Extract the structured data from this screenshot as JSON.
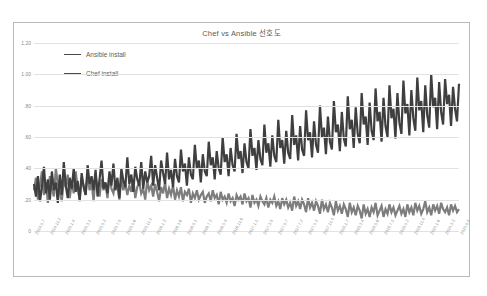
{
  "chart_data": {
    "type": "line",
    "title": "Chef vs Ansible 선호도",
    "xlabel": "",
    "ylabel": "",
    "ylim": [
      0,
      1.2
    ],
    "yticks": [
      0,
      0.2,
      0.4,
      0.6,
      0.8,
      1.0,
      1.2
    ],
    "ytick_labels": [
      "0",
      ".20",
      ".40",
      ".60",
      ".80",
      "1.00",
      "1.20"
    ],
    "grid": true,
    "legend_position": "top-left",
    "x_tick_labels": [
      "2014.9.7",
      "2014.11.2",
      "2015.1.4",
      "2015.3.1",
      "2015.5.3",
      "2015.7.5",
      "2015.9.6",
      "2015.11.1",
      "2016.1.3",
      "2016.3.6",
      "2016.5.1",
      "2016.7.3",
      "2016.9.4",
      "2016.11.6",
      "2017.1.1",
      "2017.3.5",
      "2017.5.7",
      "2017.7.2",
      "2017.9.3",
      "2017.11.5",
      "2018.1.7",
      "2018.3.4",
      "2018.5.6",
      "2018.7.1",
      "2018.9.2",
      "2018.11.4",
      "2019.1.6",
      "2019.3.3",
      "2019.5.5"
    ],
    "series": [
      {
        "name": "Ansible install",
        "values": [
          0.3,
          0.22,
          0.35,
          0.19,
          0.28,
          0.41,
          0.24,
          0.33,
          0.2,
          0.38,
          0.26,
          0.31,
          0.18,
          0.36,
          0.23,
          0.44,
          0.29,
          0.21,
          0.34,
          0.27,
          0.4,
          0.25,
          0.32,
          0.19,
          0.37,
          0.28,
          0.23,
          0.42,
          0.3,
          0.35,
          0.26,
          0.39,
          0.22,
          0.33,
          0.45,
          0.27,
          0.31,
          0.24,
          0.38,
          0.29,
          0.43,
          0.26,
          0.34,
          0.21,
          0.4,
          0.32,
          0.28,
          0.47,
          0.3,
          0.36,
          0.25,
          0.41,
          0.33,
          0.29,
          0.44,
          0.27,
          0.38,
          0.31,
          0.35,
          0.48,
          0.29,
          0.42,
          0.34,
          0.26,
          0.45,
          0.37,
          0.3,
          0.5,
          0.33,
          0.39,
          0.28,
          0.46,
          0.35,
          0.31,
          0.52,
          0.38,
          0.43,
          0.29,
          0.47,
          0.36,
          0.33,
          0.55,
          0.4,
          0.45,
          0.31,
          0.49,
          0.38,
          0.35,
          0.57,
          0.42,
          0.47,
          0.33,
          0.51,
          0.4,
          0.36,
          0.6,
          0.44,
          0.49,
          0.35,
          0.53,
          0.42,
          0.38,
          0.62,
          0.46,
          0.51,
          0.37,
          0.56,
          0.44,
          0.4,
          0.65,
          0.48,
          0.53,
          0.39,
          0.58,
          0.46,
          0.42,
          0.68,
          0.5,
          0.56,
          0.41,
          0.61,
          0.48,
          0.44,
          0.71,
          0.53,
          0.58,
          0.43,
          0.64,
          0.5,
          0.46,
          0.74,
          0.55,
          0.61,
          0.45,
          0.67,
          0.52,
          0.48,
          0.77,
          0.58,
          0.63,
          0.47,
          0.7,
          0.55,
          0.5,
          0.8,
          0.6,
          0.66,
          0.49,
          0.73,
          0.57,
          0.52,
          0.83,
          0.63,
          0.68,
          0.51,
          0.76,
          0.59,
          0.54,
          0.86,
          0.65,
          0.71,
          0.53,
          0.79,
          0.62,
          0.56,
          0.88,
          0.68,
          0.73,
          0.55,
          0.82,
          0.64,
          0.58,
          0.91,
          0.7,
          0.76,
          0.57,
          0.85,
          0.67,
          0.6,
          0.93,
          0.72,
          0.78,
          0.59,
          0.88,
          0.69,
          0.62,
          0.96,
          0.75,
          0.81,
          0.61,
          0.9,
          0.72,
          0.64,
          0.98,
          0.77,
          0.83,
          0.63,
          0.93,
          0.74,
          0.66,
          1.0,
          0.79,
          0.85,
          0.65,
          0.95,
          0.76,
          0.68,
          0.97,
          0.81,
          0.87,
          0.67,
          0.92,
          0.78,
          0.7,
          0.94
        ]
      },
      {
        "name": "Chef install",
        "values": [
          0.26,
          0.34,
          0.2,
          0.29,
          0.38,
          0.23,
          0.31,
          0.18,
          0.35,
          0.27,
          0.22,
          0.4,
          0.3,
          0.25,
          0.19,
          0.33,
          0.28,
          0.36,
          0.21,
          0.31,
          0.24,
          0.38,
          0.27,
          0.2,
          0.34,
          0.29,
          0.23,
          0.37,
          0.26,
          0.31,
          0.19,
          0.35,
          0.28,
          0.22,
          0.33,
          0.26,
          0.3,
          0.21,
          0.36,
          0.27,
          0.24,
          0.32,
          0.28,
          0.2,
          0.34,
          0.26,
          0.3,
          0.23,
          0.29,
          0.25,
          0.33,
          0.21,
          0.28,
          0.31,
          0.24,
          0.27,
          0.2,
          0.32,
          0.26,
          0.29,
          0.22,
          0.3,
          0.25,
          0.19,
          0.28,
          0.24,
          0.31,
          0.21,
          0.27,
          0.23,
          0.29,
          0.2,
          0.26,
          0.22,
          0.28,
          0.19,
          0.25,
          0.23,
          0.27,
          0.18,
          0.24,
          0.21,
          0.26,
          0.2,
          0.23,
          0.25,
          0.18,
          0.22,
          0.24,
          0.19,
          0.26,
          0.21,
          0.23,
          0.17,
          0.25,
          0.2,
          0.22,
          0.18,
          0.24,
          0.19,
          0.21,
          0.16,
          0.23,
          0.2,
          0.22,
          0.17,
          0.24,
          0.19,
          0.21,
          0.15,
          0.23,
          0.18,
          0.2,
          0.16,
          0.22,
          0.19,
          0.17,
          0.21,
          0.15,
          0.2,
          0.18,
          0.22,
          0.16,
          0.19,
          0.14,
          0.21,
          0.17,
          0.2,
          0.15,
          0.18,
          0.13,
          0.22,
          0.16,
          0.19,
          0.14,
          0.2,
          0.17,
          0.12,
          0.21,
          0.15,
          0.18,
          0.13,
          0.19,
          0.16,
          0.11,
          0.2,
          0.14,
          0.17,
          0.12,
          0.18,
          0.15,
          0.1,
          0.19,
          0.13,
          0.16,
          0.11,
          0.17,
          0.14,
          0.09,
          0.18,
          0.12,
          0.15,
          0.1,
          0.16,
          0.13,
          0.08,
          0.17,
          0.11,
          0.14,
          0.09,
          0.15,
          0.12,
          0.18,
          0.1,
          0.13,
          0.16,
          0.09,
          0.14,
          0.11,
          0.17,
          0.12,
          0.15,
          0.1,
          0.13,
          0.16,
          0.11,
          0.14,
          0.09,
          0.17,
          0.12,
          0.15,
          0.1,
          0.18,
          0.13,
          0.16,
          0.11,
          0.14,
          0.19,
          0.12,
          0.15,
          0.1,
          0.17,
          0.13,
          0.16,
          0.11,
          0.18,
          0.14,
          0.12,
          0.15,
          0.1,
          0.17,
          0.13,
          0.16,
          0.12,
          0.14
        ]
      }
    ],
    "colors": {
      "ansible": "#3f3f3f",
      "chef": "#7d7d7d",
      "grid": "#e2e2e2",
      "border": "#b9b9b9"
    }
  }
}
